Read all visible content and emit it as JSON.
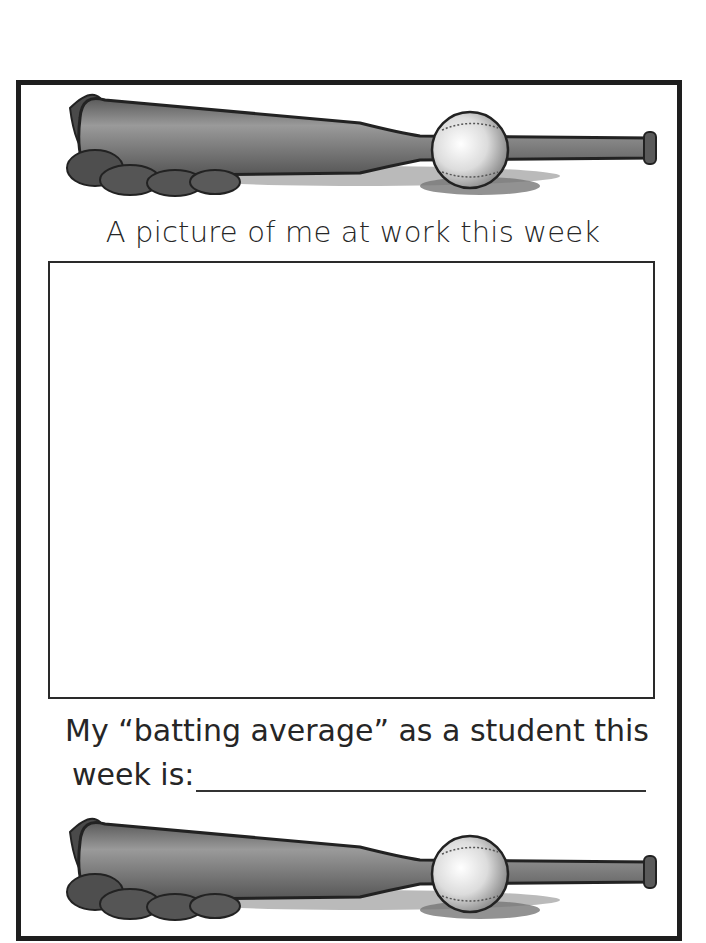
{
  "worksheet": {
    "header_art": {
      "icon": "baseball-bat-glove-ball-illustration"
    },
    "picture_section": {
      "title": "A picture of me at work this week",
      "drawing_box": {
        "value": ""
      }
    },
    "batting_average": {
      "line1": "My “batting average” as a student this",
      "line2_label": "week is:",
      "answer_value": ""
    },
    "footer_art": {
      "icon": "baseball-bat-glove-ball-illustration"
    }
  },
  "colors": {
    "border": "#1e1e1e",
    "text": "#262626",
    "bat": "#6e6e6e",
    "glove": "#4a4a4a"
  }
}
